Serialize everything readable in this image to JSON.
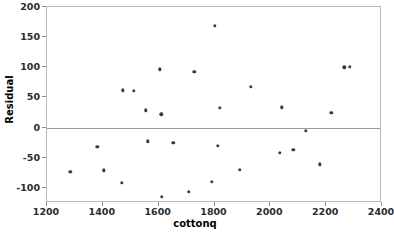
{
  "chart_data": {
    "type": "scatter",
    "title": "",
    "xlabel": "cottonq",
    "ylabel": "Residual",
    "xlim": [
      1200,
      2400
    ],
    "ylim": [
      -125,
      200
    ],
    "xticks": [
      1200,
      1400,
      1600,
      1800,
      2000,
      2200,
      2400
    ],
    "yticks": [
      200,
      150,
      100,
      50,
      0,
      -50,
      -100
    ],
    "grid": false,
    "legend": null,
    "reference_line": {
      "axis": "y",
      "value": 0
    },
    "marker_color": "#3b3b3b",
    "frame_color": "#b9b9b9",
    "series": [
      {
        "name": "residuals",
        "x": [
          1283,
          1380,
          1403,
          1468,
          1471,
          1512,
          1553,
          1562,
          1605,
          1610,
          1612,
          1653,
          1708,
          1727,
          1790,
          1802,
          1812,
          1818,
          1890,
          1930,
          2035,
          2040,
          2082,
          2128,
          2178,
          2218,
          2265,
          2285
        ],
        "y": [
          -73,
          -32,
          -71,
          -92,
          62,
          61,
          29,
          -23,
          97,
          22,
          -115,
          -25,
          -106,
          93,
          -90,
          169,
          -30,
          33,
          -70,
          68,
          -42,
          34,
          -37,
          -5,
          -61,
          25,
          100,
          101
        ]
      }
    ]
  }
}
